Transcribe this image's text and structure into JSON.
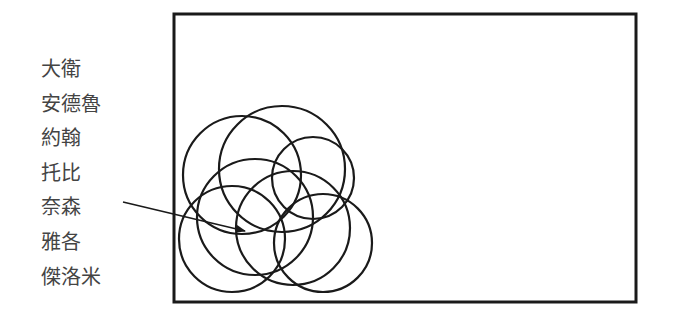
{
  "labels": [
    "大衛",
    "安德魯",
    "約翰",
    "托比",
    "奈森",
    "雅各",
    "傑洛米"
  ],
  "colors": {
    "stroke": "#1a1a1a",
    "label_text": "#444444",
    "background": "#ffffff"
  },
  "frame": {
    "x": 174,
    "y": 14,
    "width": 462,
    "height": 288
  },
  "arrow": {
    "from": [
      123,
      202
    ],
    "to": [
      245,
      231
    ]
  },
  "circles": [
    {
      "cx": 242,
      "cy": 175,
      "r": 59
    },
    {
      "cx": 282,
      "cy": 169,
      "r": 63
    },
    {
      "cx": 313,
      "cy": 178,
      "r": 41
    },
    {
      "cx": 232,
      "cy": 239,
      "r": 53
    },
    {
      "cx": 255,
      "cy": 217,
      "r": 58
    },
    {
      "cx": 293,
      "cy": 228,
      "r": 57
    },
    {
      "cx": 323,
      "cy": 243,
      "r": 49
    }
  ]
}
